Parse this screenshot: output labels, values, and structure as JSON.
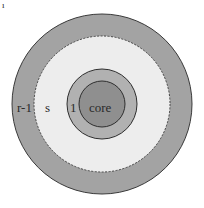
{
  "diagram": {
    "type": "concentric-rings",
    "center": [
      102,
      104
    ],
    "layers": [
      {
        "name": "r-1",
        "label": "r-1",
        "radius": 90,
        "fill": "#a3a3a3",
        "border": "solid"
      },
      {
        "name": "s",
        "label": "s",
        "radius": 68,
        "fill": "#ededed",
        "border": "dashed"
      },
      {
        "name": "1",
        "label": "1",
        "radius": 35,
        "fill": "#b1b1b1",
        "border": "solid"
      },
      {
        "name": "core",
        "label": "core",
        "radius": 23,
        "fill": "#8f8f8f",
        "border": "solid"
      }
    ],
    "mark": "ı"
  }
}
